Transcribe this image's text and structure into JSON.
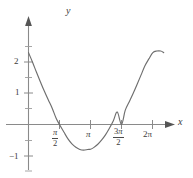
{
  "figure": {
    "name": "cartesian-plot",
    "background": "#ffffff",
    "curve_color": "#6e6e6e",
    "axis_color": "#8a8a8a",
    "text_color": "#3b3b3b"
  },
  "axes": {
    "x_name": "x",
    "y_name": "y",
    "x_ticks": [
      {
        "value": 1.5708,
        "label_num": "π",
        "label_den": "2",
        "type": "fraction",
        "lead": ""
      },
      {
        "value": 3.1416,
        "label": "π",
        "type": "plain"
      },
      {
        "value": 4.7124,
        "label_num": "π",
        "label_den": "2",
        "type": "fraction",
        "lead": "3"
      },
      {
        "value": 6.2832,
        "label": "2π",
        "type": "plain"
      }
    ],
    "y_ticks": [
      {
        "value": 2,
        "label": "2"
      },
      {
        "value": 1,
        "label": "1"
      },
      {
        "value": -1,
        "label": "−1"
      }
    ],
    "y_minor_ticks": [
      2.5,
      1.5,
      0.5,
      -0.5,
      -1.5
    ],
    "xlim": [
      -0.35,
      7.4
    ],
    "ylim": [
      -1.85,
      2.75
    ],
    "grid": false
  },
  "chart_data": {
    "type": "line",
    "title": "",
    "xlabel": "x",
    "ylabel": "y",
    "xlim": [
      -0.35,
      7.4
    ],
    "ylim": [
      -1.85,
      2.75
    ],
    "grid": false,
    "legend": "none",
    "series": [
      {
        "name": "curve",
        "color": "#6e6e6e",
        "x": [
          0.0,
          0.2,
          0.4,
          0.6,
          0.8,
          1.0,
          1.2,
          1.4,
          1.5708,
          1.8,
          2.0,
          2.2,
          2.4,
          2.6,
          2.8,
          3.0,
          3.1416,
          3.3,
          3.5,
          3.7,
          3.9,
          4.1,
          4.3,
          4.5,
          4.7124,
          4.9,
          5.1,
          5.3,
          5.5,
          5.7,
          5.9,
          6.1,
          6.3,
          6.5,
          6.7,
          6.85
        ],
        "y": [
          2.3,
          2.0,
          1.68,
          1.37,
          1.07,
          0.79,
          0.52,
          0.2,
          0.0,
          -0.25,
          -0.46,
          -0.62,
          -0.73,
          -0.8,
          -0.82,
          -0.8,
          -0.79,
          -0.74,
          -0.64,
          -0.5,
          -0.33,
          -0.12,
          0.12,
          0.4,
          0.0,
          0.45,
          0.72,
          0.99,
          1.28,
          1.58,
          1.88,
          2.1,
          2.3,
          2.35,
          2.35,
          2.3
        ]
      }
    ],
    "roots": [
      1.5708,
      4.7124
    ],
    "minimum": {
      "x": 2.95,
      "y": -0.82
    },
    "y_at_zero": 2.3,
    "x_tick_labels": [
      "π/2",
      "π",
      "3π/2",
      "2π"
    ],
    "y_tick_labels": [
      "2",
      "1",
      "−1"
    ]
  }
}
